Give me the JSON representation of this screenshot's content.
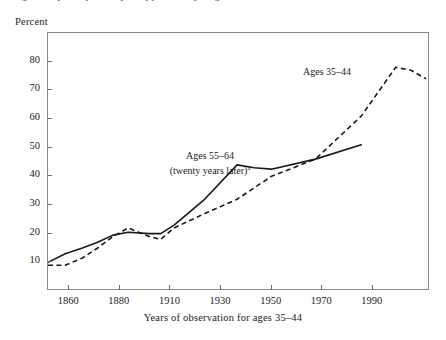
{
  "figure": {
    "top_cut_text": "figure caption partially cropped at top edge",
    "y_axis_title": "Percent",
    "x_axis_caption": "Years of observation for ages 35–44"
  },
  "annotations": {
    "series_b_label": "Ages 35–44",
    "series_a_label_line1": "Ages 55–64",
    "series_a_label_line2": "(twenty years later)",
    "series_a_footnote_marker": "a"
  },
  "axes": {
    "y_ticks": [
      10,
      20,
      30,
      40,
      50,
      60,
      70,
      80
    ],
    "x_ticks": [
      "1860",
      "1880",
      "1910",
      "1930",
      "1950",
      "1970",
      "1990"
    ]
  },
  "colors": {
    "line": "#1a1a1a",
    "frame": "#8a8a8a",
    "text": "#222222"
  },
  "chart_data": {
    "type": "line",
    "title": "",
    "subtitle": "",
    "xlabel": "Years of observation for ages 35–44",
    "ylabel": "Percent",
    "ylim": [
      0,
      90
    ],
    "y_ticks": [
      10,
      20,
      30,
      40,
      50,
      60,
      70,
      80
    ],
    "x_ticks": [
      "1860",
      "1880",
      "1910",
      "1930",
      "1950",
      "1970",
      "1990"
    ],
    "x_tick_spacing": "even (non-linear year intervals)",
    "grid": false,
    "legend": "inline annotations on plot",
    "series": [
      {
        "name": "Ages 55–64 (twenty years later)",
        "style": "solid",
        "x": [
          "1860",
          "1870",
          "1880",
          "1890",
          "1900",
          "1910",
          "1920",
          "1925",
          "1930",
          "1940",
          "1950",
          "1955",
          "1960",
          "1970",
          "1980"
        ],
        "x_pos": [
          0,
          4.5,
          9.0,
          13.0,
          17.0,
          21.0,
          26.5,
          29.5,
          33.0,
          41.0,
          49.5,
          54.0,
          58.5,
          70.0,
          82.0
        ],
        "values": [
          10,
          13,
          15,
          17,
          19.5,
          20.5,
          20,
          20,
          23,
          32,
          44,
          43,
          42.5,
          46,
          51
        ]
      },
      {
        "name": "Ages 35–44",
        "style": "dashed",
        "x": [
          "1860",
          "1870",
          "1880",
          "1890",
          "1900",
          "1910",
          "1920",
          "1925",
          "1930",
          "1940",
          "1950",
          "1960",
          "1970",
          "1980",
          "1990",
          "1995",
          "2000"
        ],
        "x_pos": [
          0,
          4.5,
          9.0,
          13.0,
          17.0,
          21.0,
          26.5,
          29.5,
          33.0,
          41.0,
          49.5,
          58.5,
          70.0,
          82.0,
          91.0,
          95.0,
          99.0
        ],
        "values": [
          9,
          9,
          11.5,
          15,
          19,
          22,
          19,
          18,
          22,
          27,
          32,
          40,
          46,
          61,
          78,
          77,
          74
        ]
      }
    ],
    "annotations": [
      {
        "text": "Ages 35–44",
        "near_series": "Ages 35–44"
      },
      {
        "text": "Ages 55–64 (twenty years later)a",
        "near_series": "Ages 55–64 (twenty years later)"
      }
    ]
  }
}
